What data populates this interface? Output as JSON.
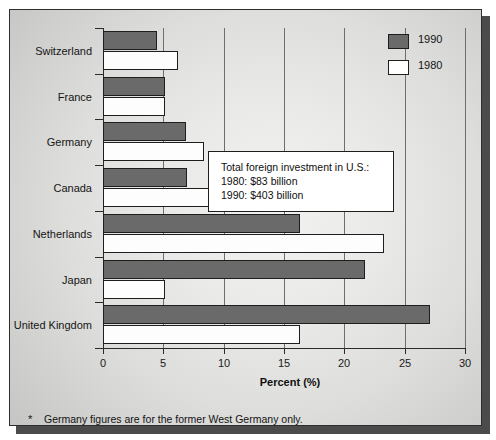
{
  "chart_data": {
    "type": "bar",
    "orientation": "horizontal",
    "title": "",
    "xlabel": "Percent (%)",
    "ylabel": "",
    "xlim": [
      0,
      30
    ],
    "xticks": [
      0,
      5,
      10,
      15,
      20,
      25,
      30
    ],
    "xtick_labels": [
      "0",
      "5",
      "10",
      "15",
      "20",
      "25",
      "30"
    ],
    "grid": true,
    "grid_axis": "x",
    "legend_position": "top-right",
    "categories": [
      "Switzerland",
      "France",
      "Germany",
      "Canada",
      "Netherlands",
      "Japan",
      "United Kingdom"
    ],
    "series": [
      {
        "name": "1990",
        "color": "#6a6a6a",
        "values": [
          4.5,
          5.1,
          6.9,
          7.0,
          16.3,
          21.7,
          27.1
        ]
      },
      {
        "name": "1980",
        "color": "#ffffff",
        "values": [
          6.2,
          5.1,
          8.4,
          14.2,
          23.3,
          5.1,
          16.3
        ]
      }
    ],
    "annotations": [
      "Total foreign investment in U.S.:",
      "1980: $83 billion",
      "1990: $403 billion"
    ]
  },
  "legend": {
    "items": [
      {
        "label": "1990",
        "swatch": "filled-dark"
      },
      {
        "label": "1980",
        "swatch": "filled-white"
      }
    ]
  },
  "callout": {
    "line1": "Total foreign investment in U.S.:",
    "line2": "1980: $83 billion",
    "line3": "1990: $403 billion"
  },
  "footnote": {
    "marker": "*",
    "text": "Germany figures are for the former West Germany only."
  },
  "axis": {
    "x_title": "Percent (%)"
  }
}
